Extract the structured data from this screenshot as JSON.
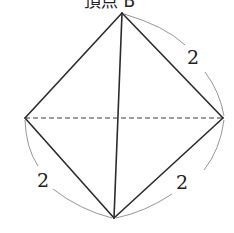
{
  "figure": {
    "type": "octahedron-like solid (square bipyramid view)",
    "top_caption": "頂点 B",
    "vertices": {
      "top": [
        122,
        13
      ],
      "left": [
        25,
        118
      ],
      "right": [
        223,
        118
      ],
      "bottom": [
        114,
        218
      ]
    },
    "edge_labels": {
      "top_right": "2",
      "bottom_left": "2",
      "bottom_right": "2"
    },
    "colors": {
      "edge": "#2b2b2b",
      "dimension_arc": "#8a8a8a",
      "background": "#ffffff"
    }
  }
}
